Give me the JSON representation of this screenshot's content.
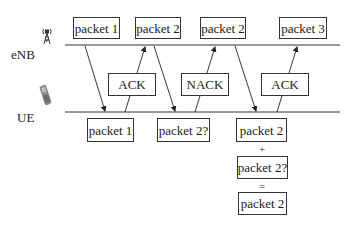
{
  "nodes": {
    "enb": {
      "label": "eNB",
      "icon": "cell-tower-icon"
    },
    "ue": {
      "label": "UE",
      "icon": "mobile-phone-icon"
    }
  },
  "top_packets": [
    {
      "label": "packet 1"
    },
    {
      "label": "packet 2"
    },
    {
      "label": "packet 2"
    },
    {
      "label": "packet 3"
    }
  ],
  "feedback": [
    {
      "label": "ACK"
    },
    {
      "label": "NACK"
    },
    {
      "label": "ACK"
    }
  ],
  "ue_packets": [
    {
      "label": "packet 1"
    },
    {
      "label": "packet 2?"
    }
  ],
  "combining": {
    "first": "packet 2",
    "plus": "+",
    "second": "packet 2?",
    "equals": "=",
    "result": "packet 2"
  },
  "colors": {
    "line": "#333333",
    "box_border": "#333333",
    "background": "#ffffff"
  }
}
